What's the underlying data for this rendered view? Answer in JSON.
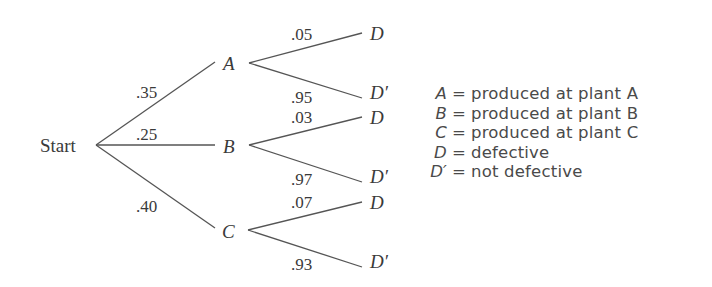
{
  "tree": {
    "root": "Start",
    "level1": [
      {
        "label": "A",
        "prob": ".35"
      },
      {
        "label": "B",
        "prob": ".25"
      },
      {
        "label": "C",
        "prob": ".40"
      }
    ],
    "level2": {
      "A": [
        {
          "label": "D",
          "prob": ".05"
        },
        {
          "label": "D′",
          "prob": ".95"
        }
      ],
      "B": [
        {
          "label": "D",
          "prob": ".03"
        },
        {
          "label": "D′",
          "prob": ".97"
        }
      ],
      "C": [
        {
          "label": "D",
          "prob": ".07"
        },
        {
          "label": "D′",
          "prob": ".93"
        }
      ]
    }
  },
  "legend": [
    {
      "key": "A",
      "eq": "=",
      "text": "produced at plant A"
    },
    {
      "key": "B",
      "eq": "=",
      "text": "produced at plant B"
    },
    {
      "key": "C",
      "eq": "=",
      "text": "produced at plant C"
    },
    {
      "key": "D",
      "eq": "=",
      "text": "defective"
    },
    {
      "key": "D′",
      "eq": "=",
      "text": "not defective"
    }
  ]
}
